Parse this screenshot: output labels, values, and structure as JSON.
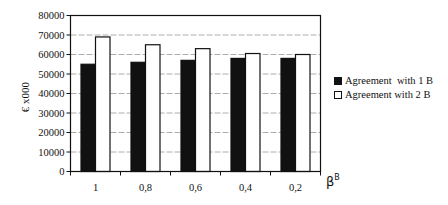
{
  "chart_data": {
    "type": "bar",
    "title": "",
    "xlabel": "β^B",
    "xlabel_main": "β",
    "xlabel_sup": "B",
    "ylabel": "€ x000",
    "ylim": [
      0,
      80000
    ],
    "yticks": [
      0,
      10000,
      20000,
      30000,
      40000,
      50000,
      60000,
      70000,
      80000
    ],
    "ytick_labels": [
      "0",
      "10000",
      "20000",
      "30000",
      "40000",
      "50000",
      "60000",
      "70000",
      "80000"
    ],
    "grid": true,
    "legend_position": "right",
    "categories": [
      "1",
      "0,8",
      "0,6",
      "0,4",
      "0,2"
    ],
    "series": [
      {
        "name": "Agreement  with 1 B",
        "color": "#111111",
        "values": [
          55000,
          56000,
          57000,
          58000,
          58000
        ]
      },
      {
        "name": "Agreement with 2 B",
        "color": "#ffffff",
        "values": [
          69000,
          65000,
          63000,
          60500,
          60000
        ]
      }
    ]
  }
}
